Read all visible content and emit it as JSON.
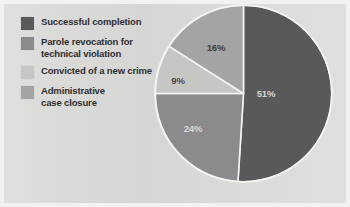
{
  "chart_data": {
    "type": "pie",
    "title": "",
    "categories": [
      "Successful completion",
      "Parole revocation for technical violation",
      "Convicted of a new crime",
      "Administrative case closure"
    ],
    "values": [
      51,
      24,
      9,
      16
    ],
    "value_labels": [
      "51%",
      "24%",
      "9%",
      "16%"
    ],
    "units": "percent",
    "total": 100,
    "start_angle_deg": 0,
    "direction": "clockwise",
    "legend_position": "left",
    "grid": false,
    "colors": [
      "#59595b",
      "#8b8b8d",
      "#c6c6c4",
      "#a4a4a4"
    ],
    "slice_label_colors": [
      "#d5d5d3",
      "#d9d9d7",
      "#4a4a4c",
      "#3d3d3f"
    ],
    "slice_outline_color": "#f4f4f2",
    "background_color": "#d9d9d7"
  },
  "legend": {
    "items": [
      {
        "label": "Successful completion",
        "color": "#59595b",
        "value_label": "51%"
      },
      {
        "label": "Parole revocation for\ntechnical violation",
        "color": "#8b8b8d",
        "value_label": "24%"
      },
      {
        "label": "Convicted of a new crime",
        "color": "#c6c6c4",
        "value_label": "9%"
      },
      {
        "label": "Administrative\ncase closure",
        "color": "#a4a4a4",
        "value_label": "16%"
      }
    ]
  },
  "pie_labels": {
    "slice_1": "51%",
    "slice_2": "24%",
    "slice_3": "9%",
    "slice_4": "16%"
  }
}
